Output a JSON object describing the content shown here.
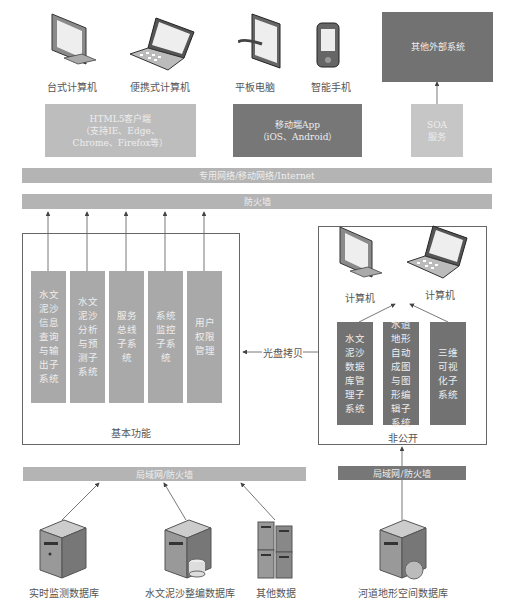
{
  "clients": {
    "desktop": {
      "label": "台式计算机",
      "icon": "desktop-monitor-icon"
    },
    "laptop": {
      "label": "便携式计算机",
      "icon": "laptop-icon"
    },
    "tablet": {
      "label": "平板电脑",
      "icon": "tablet-icon"
    },
    "phone": {
      "label": "智能手机",
      "icon": "smartphone-icon"
    }
  },
  "client_types": {
    "html5": {
      "line1": "HTML5客户端",
      "line2": "（支持IE、Edge、",
      "line3": "Chrome、Firefox等）"
    },
    "mobile": {
      "line1": "移动端App",
      "line2": "（iOS、Android）"
    },
    "soa": {
      "line1": "SOA",
      "line2": "服务"
    },
    "external": {
      "label": "其他外部系统"
    }
  },
  "network": {
    "internet_bar": "专用网络/移动网络/Internet",
    "firewall_bar": "防火墙",
    "lan_left": "局域网/防火墙",
    "lan_right": "局域网/防火墙"
  },
  "basic_functions": {
    "title": "基本功能",
    "modules": [
      "水文泥沙信息查询与输出子系统",
      "水文泥沙分析与预测子系统",
      "服务总线子系统",
      "系统监控子系统",
      "用户权限管理"
    ]
  },
  "disc_copy": "光盘拷贝",
  "non_public": {
    "title": "非公开",
    "computer1": "计算机",
    "computer2": "计算机",
    "modules": [
      "水文泥沙数据库管理子系统",
      "水道地形自动成图与图形编辑子系统",
      "三维可视化子系统"
    ]
  },
  "databases": {
    "realtime": "实时监测数据库",
    "compiled": "水文泥沙整编数据库",
    "other": "其他数据",
    "terrain": "河道地形空间数据库"
  },
  "colors": {
    "light_gray": "#b9b9b9",
    "mid_gray": "#a6a6a6",
    "dark_gray": "#727272",
    "frame": "#666666"
  }
}
